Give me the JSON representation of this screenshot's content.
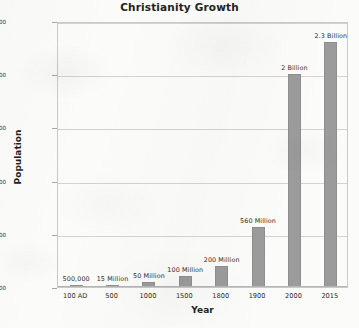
{
  "chart_data": {
    "type": "bar",
    "title": "Christianity Growth",
    "xlabel": "Year",
    "ylabel": "Population",
    "categories": [
      "100 AD",
      "500",
      "1000",
      "1500",
      "1800",
      "1900",
      "2000",
      "2015"
    ],
    "values": [
      500000,
      15000000,
      50000000,
      100000000,
      200000000,
      560000000,
      2000000000,
      2300000000
    ],
    "data_labels": [
      "500,000",
      "15 Million",
      "50 Million",
      "100 Million",
      "200 Million",
      "560 Million",
      "2 Billion",
      "2.3 Billion"
    ],
    "ytick_labels": [
      "500,000",
      "500,500,000",
      "1,000,500,000",
      "1,500,500,000",
      "2,000,500,000",
      "2,500,500,000"
    ],
    "ytick_values": [
      500000,
      500500000,
      1000500000,
      1500500000,
      2000500000,
      2500500000
    ],
    "ylim": [
      500000,
      2500500000
    ],
    "grid": true,
    "legend": "none",
    "series_color": "#9b9b9b"
  }
}
